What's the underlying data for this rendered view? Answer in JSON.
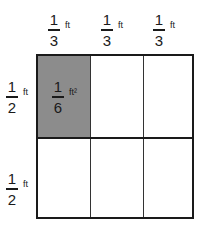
{
  "diagram": {
    "top_labels": [
      {
        "num": "1",
        "den": "3",
        "unit": "ft"
      },
      {
        "num": "1",
        "den": "3",
        "unit": "ft"
      },
      {
        "num": "1",
        "den": "3",
        "unit": "ft"
      }
    ],
    "side_labels": [
      {
        "num": "1",
        "den": "2",
        "unit": "ft"
      },
      {
        "num": "1",
        "den": "2",
        "unit": "ft"
      }
    ],
    "shaded_cell": {
      "num": "1",
      "den": "6",
      "unit": "ft²",
      "row": 0,
      "col": 0,
      "color": "#8c8c8c"
    },
    "grid": {
      "rows": 2,
      "cols": 3
    }
  }
}
